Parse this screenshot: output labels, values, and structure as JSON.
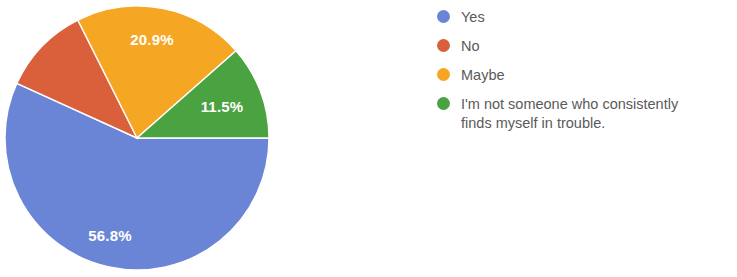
{
  "chart_data": {
    "type": "pie",
    "title": "",
    "legend_position": "right",
    "grid": false,
    "categories": [
      "Yes",
      "No",
      "Maybe",
      "I'm not someone who consistently finds myself in trouble."
    ],
    "values": [
      56.8,
      10.8,
      20.9,
      11.5
    ],
    "value_unit": "%",
    "colors": [
      "#6b85d6",
      "#d9603a",
      "#f5a623",
      "#4aa340"
    ],
    "slices": [
      {
        "label": "Yes",
        "value": 56.8,
        "display": "56.8%",
        "color": "#6b85d6",
        "label_shown": true,
        "start_angle_deg": 0,
        "end_angle_deg": 204.48
      },
      {
        "label": "No",
        "value": 10.8,
        "display": "10.8%",
        "color": "#d9603a",
        "label_shown": false,
        "start_angle_deg": 204.48,
        "end_angle_deg": 243.36
      },
      {
        "label": "Maybe",
        "value": 20.9,
        "display": "20.9%",
        "color": "#f5a623",
        "label_shown": true,
        "start_angle_deg": 243.36,
        "end_angle_deg": 318.6
      },
      {
        "label": "I'm not someone who consistently finds myself in trouble.",
        "value": 11.5,
        "display": "11.5%",
        "color": "#4aa340",
        "label_shown": true,
        "start_angle_deg": 318.6,
        "end_angle_deg": 360
      }
    ],
    "data_labels": [
      {
        "text": "20.9%",
        "x": 152,
        "y": 41
      },
      {
        "text": "11.5%",
        "x": 222,
        "y": 108
      },
      {
        "text": "56.8%",
        "x": 110,
        "y": 237
      }
    ]
  },
  "legend": {
    "items": [
      {
        "label": "Yes",
        "color": "#6b85d6",
        "swatch": "legend-dot-yes"
      },
      {
        "label": "No",
        "color": "#d9603a",
        "swatch": "legend-dot-no"
      },
      {
        "label": "Maybe",
        "color": "#f5a623",
        "swatch": "legend-dot-maybe"
      },
      {
        "label": "I'm not someone who consistently\nfinds myself in trouble.",
        "color": "#4aa340",
        "swatch": "legend-dot-other"
      }
    ]
  }
}
